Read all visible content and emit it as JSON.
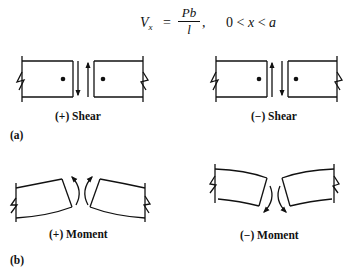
{
  "equation": {
    "lhs": "V",
    "lhs_sub": "x",
    "equals": "=",
    "numerator": "Pb",
    "denominator": "l",
    "comma": ",",
    "range_lower": "0",
    "lt1": "<",
    "range_var": "x",
    "lt2": "<",
    "range_upper": "a"
  },
  "panel_a": {
    "label": "(a)",
    "left_caption": "(+) Shear",
    "right_caption": "(−) Shear"
  },
  "panel_b": {
    "label": "(b)",
    "left_caption": "(+) Moment",
    "right_caption": "(−) Moment"
  },
  "colors": {
    "ink": "#111111",
    "background": "#ffffff"
  }
}
